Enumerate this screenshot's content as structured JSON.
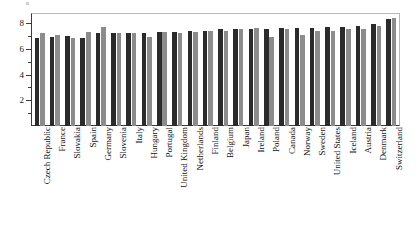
{
  "chart_data": {
    "type": "bar",
    "title": "",
    "subtitle": "",
    "xlabel": "",
    "ylabel": "",
    "ylim": [
      0,
      8.7
    ],
    "grid": false,
    "legend_position": "none",
    "y_ticks_major": [
      2,
      4,
      6,
      8
    ],
    "y_ticks_minor": [
      1,
      3,
      5,
      7
    ],
    "y_tick_labels": [
      "2",
      "4",
      "6",
      "8"
    ],
    "categories": [
      "Czech Republic",
      "France",
      "Slovakia",
      "Spain",
      "Germany",
      "Slovenia",
      "Italy",
      "Hungary",
      "Portugal",
      "United Kingdom",
      "Netherlands",
      "Finland",
      "Belgium",
      "Japan",
      "Ireland",
      "Poland",
      "Canada",
      "Norway",
      "Sweden",
      "United States",
      "Iceland",
      "Austria",
      "Denmark",
      "Switzerland"
    ],
    "series": [
      {
        "name": "series-dark",
        "color": "#2b2b2b",
        "values": [
          6.8,
          6.9,
          7.0,
          6.8,
          7.2,
          7.2,
          7.2,
          7.2,
          7.3,
          7.3,
          7.4,
          7.4,
          7.5,
          7.5,
          7.5,
          7.5,
          7.6,
          7.6,
          7.6,
          7.7,
          7.7,
          7.8,
          7.9,
          8.3
        ]
      },
      {
        "name": "series-light",
        "color": "#8c8c8c",
        "values": [
          7.2,
          7.1,
          6.8,
          7.3,
          7.7,
          7.2,
          7.2,
          6.9,
          7.3,
          7.2,
          7.3,
          7.4,
          7.4,
          7.5,
          7.6,
          6.9,
          7.5,
          7.1,
          7.4,
          7.4,
          7.5,
          7.5,
          7.8,
          8.4
        ]
      }
    ]
  }
}
